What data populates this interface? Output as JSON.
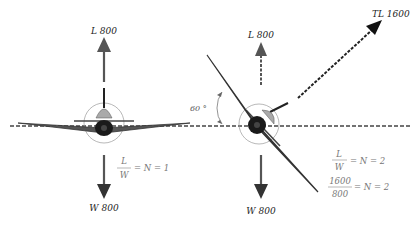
{
  "diagram": {
    "left": {
      "lift_label": "L 800",
      "weight_label": "W 800",
      "equation": {
        "num": "L",
        "den": "W",
        "rhs": "= N = 1"
      }
    },
    "right": {
      "lift_label": "L 800",
      "total_lift_label": "TL 1600",
      "weight_label": "W 800",
      "bank_angle": "60 °",
      "equation1": {
        "num": "L",
        "den": "W",
        "rhs": "= N = 2"
      },
      "equation2": {
        "num": "1600",
        "den": "800",
        "rhs": "= N = 2"
      }
    },
    "colors": {
      "arrow": "#555555",
      "arrow_dark": "#111111",
      "horizon": "#444444",
      "wing": "#555555",
      "canopy": "#aaaaaa",
      "equation_text": "#777777"
    }
  }
}
